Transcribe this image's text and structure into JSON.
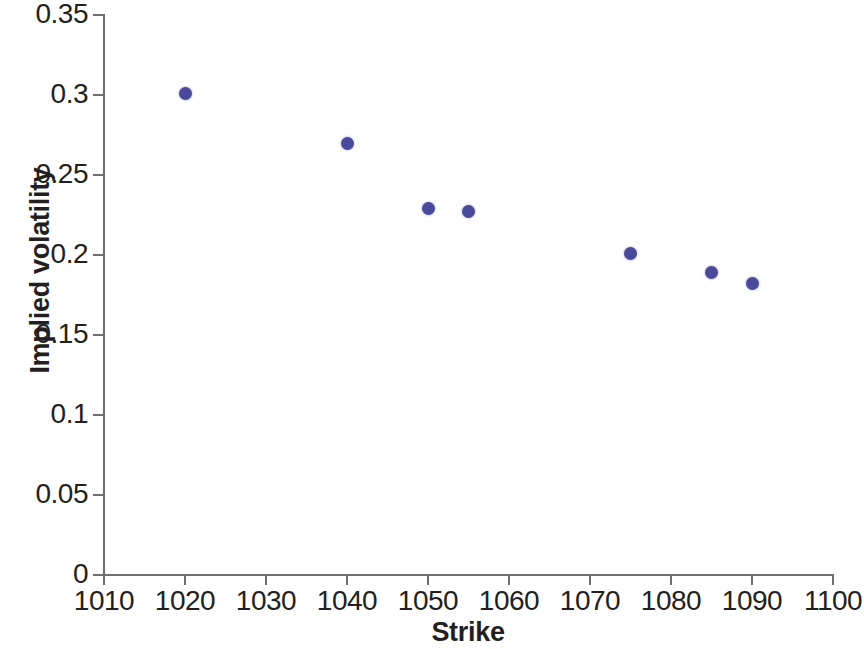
{
  "chart_data": {
    "type": "scatter",
    "title": "",
    "xlabel": "Strike",
    "ylabel": "Implied volatility",
    "xlim": [
      1010,
      1100
    ],
    "ylim": [
      0,
      0.35
    ],
    "xticks": [
      1010,
      1020,
      1030,
      1040,
      1050,
      1060,
      1070,
      1080,
      1090,
      1100
    ],
    "xticklabels": [
      "1010",
      "1020",
      "1030",
      "1040",
      "1050",
      "1060",
      "1070",
      "1080",
      "1090",
      "1100"
    ],
    "yticks": [
      0,
      0.05,
      0.1,
      0.15,
      0.2,
      0.25,
      0.3,
      0.35
    ],
    "yticklabels": [
      "0",
      "0.05",
      "0.1",
      "0.15",
      "0.2",
      "0.25",
      "0.3",
      "0.35"
    ],
    "grid": false,
    "legend": null,
    "marker_color": "#4a4a9c",
    "axis_color": "#6e6e72",
    "text_color": "#231f20",
    "background": "#ffffff",
    "x": [
      1020,
      1040,
      1050,
      1055,
      1075,
      1085,
      1090
    ],
    "y": [
      0.301,
      0.27,
      0.229,
      0.227,
      0.201,
      0.189,
      0.182
    ],
    "points": [
      {
        "x": 1020,
        "y": 0.301
      },
      {
        "x": 1040,
        "y": 0.27
      },
      {
        "x": 1050,
        "y": 0.229
      },
      {
        "x": 1055,
        "y": 0.227
      },
      {
        "x": 1075,
        "y": 0.201
      },
      {
        "x": 1085,
        "y": 0.189
      },
      {
        "x": 1090,
        "y": 0.182
      }
    ]
  }
}
